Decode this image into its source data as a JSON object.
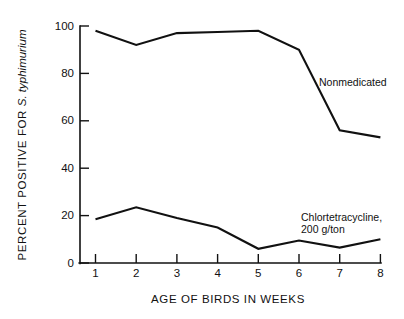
{
  "chart_data": {
    "type": "line",
    "title": "",
    "xlabel": "AGE OF BIRDS IN WEEKS",
    "ylabel": "PERCENT POSITIVE  FOR S. typhimurium",
    "ylabel_plain": "PERCENT POSITIVE  FOR ",
    "ylabel_italic": "S. typhimurium",
    "x": [
      1,
      2,
      3,
      4,
      5,
      6,
      7,
      8
    ],
    "categories": [
      "1",
      "2",
      "3",
      "4",
      "5",
      "6",
      "7",
      "8"
    ],
    "xlim": [
      1,
      8
    ],
    "ylim": [
      0,
      100
    ],
    "yticks": [
      0,
      20,
      40,
      60,
      80,
      100
    ],
    "ytick_labels": [
      "0",
      "20",
      "40",
      "60",
      "80",
      "100"
    ],
    "xtick_labels": [
      "1",
      "2",
      "3",
      "4",
      "5",
      "6",
      "7",
      "8"
    ],
    "grid": false,
    "legend_position": "inline-annotation",
    "line_color": "#111111",
    "background_color": "#ffffff",
    "series": [
      {
        "name": "Nonmedicated",
        "values": [
          98,
          92,
          97,
          97.5,
          98,
          90,
          56,
          53
        ]
      },
      {
        "name": "Chlortetracycline, 200 g/ton",
        "values": [
          18.5,
          23.5,
          19,
          15,
          6,
          9.5,
          6.5,
          10
        ]
      }
    ],
    "annotations": [
      {
        "name": "nonmedicated-label",
        "text": "Nonmedicated",
        "lines": [
          "Nonmedicated"
        ],
        "x": 6.55,
        "y": 83
      },
      {
        "name": "chlortetracycline-label",
        "text": "Chlortetracycline, 200 g/ton",
        "lines": [
          "Chlortetracycline,",
          "200 g/ton"
        ],
        "x": 6.35,
        "y": 20
      }
    ]
  },
  "labels": {
    "ytick_0": "0",
    "ytick_20": "20",
    "ytick_40": "40",
    "ytick_60": "60",
    "ytick_80": "80",
    "ytick_100": "100",
    "xtick_1": "1",
    "xtick_2": "2",
    "xtick_3": "3",
    "xtick_4": "4",
    "xtick_5": "5",
    "xtick_6": "6",
    "xtick_7": "7",
    "xtick_8": "8",
    "x_axis_title": "AGE OF BIRDS IN WEEKS",
    "y_axis_title_plain": "PERCENT POSITIVE  FOR ",
    "y_axis_title_italic": "S. typhimurium",
    "annot_nonmedicated": "Nonmedicated",
    "annot_chlor_line1": "Chlortetracycline,",
    "annot_chlor_line2": "200 g/ton"
  }
}
